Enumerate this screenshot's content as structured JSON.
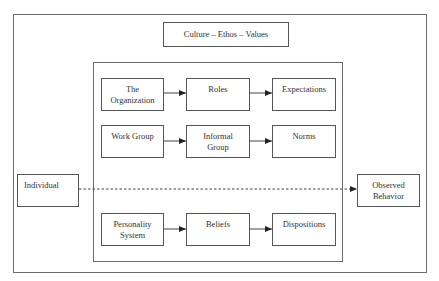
{
  "diagram": {
    "type": "flow-diagram",
    "colors": {
      "line": "#555555",
      "frame": "#6b6b6b",
      "text": "#333333",
      "background": "#ffffff"
    },
    "culture_box": {
      "label": "Culture – Ethos – Values"
    },
    "left_node": {
      "label": "Individual"
    },
    "right_node": {
      "line1": "Observed",
      "line2": "Behavior"
    },
    "rows": [
      {
        "nodes": [
          {
            "line1": "The",
            "line2": "Organization"
          },
          {
            "line1": "Roles",
            "line2": ""
          },
          {
            "line1": "Expectations",
            "line2": ""
          }
        ]
      },
      {
        "nodes": [
          {
            "line1": "Work Group",
            "line2": ""
          },
          {
            "line1": "Informal",
            "line2": "Group"
          },
          {
            "line1": "Norms",
            "line2": ""
          }
        ]
      },
      {
        "nodes": [
          {
            "line1": "Personality",
            "line2": "System"
          },
          {
            "line1": "Beliefs",
            "line2": ""
          },
          {
            "line1": "Dispositions",
            "line2": ""
          }
        ]
      }
    ],
    "edges": [
      {
        "from": "The Organization",
        "to": "Roles",
        "style": "solid"
      },
      {
        "from": "Roles",
        "to": "Expectations",
        "style": "solid"
      },
      {
        "from": "Work Group",
        "to": "Informal Group",
        "style": "solid"
      },
      {
        "from": "Informal Group",
        "to": "Norms",
        "style": "solid"
      },
      {
        "from": "Personality System",
        "to": "Beliefs",
        "style": "solid"
      },
      {
        "from": "Beliefs",
        "to": "Dispositions",
        "style": "solid"
      },
      {
        "from": "Individual",
        "to": "Observed Behavior",
        "style": "dashed"
      }
    ]
  }
}
